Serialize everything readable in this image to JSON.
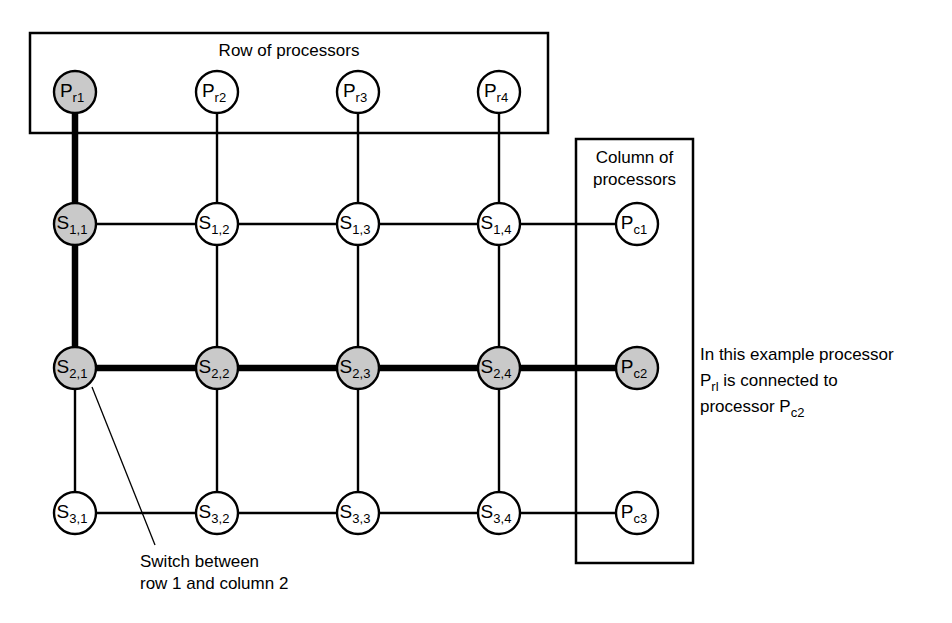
{
  "diagram": {
    "row_box": {
      "label": "Row of processors",
      "x": 30,
      "y": 33,
      "width": 518,
      "height": 100
    },
    "column_box": {
      "label_line1": "Column of",
      "label_line2": "processors",
      "x": 576,
      "y": 139,
      "width": 117,
      "height": 424
    },
    "row_processors": [
      {
        "id": "Pr1",
        "base": "P",
        "sub": "r1",
        "cx": 75,
        "cy": 92,
        "r": 21,
        "state": "active"
      },
      {
        "id": "Pr2",
        "base": "P",
        "sub": "r2",
        "cx": 217,
        "cy": 92,
        "r": 21,
        "state": "plain"
      },
      {
        "id": "Pr3",
        "base": "P",
        "sub": "r3",
        "cx": 358,
        "cy": 92,
        "r": 21,
        "state": "plain"
      },
      {
        "id": "Pr4",
        "base": "P",
        "sub": "r4",
        "cx": 499,
        "cy": 92,
        "r": 21,
        "state": "plain"
      }
    ],
    "column_processors": [
      {
        "id": "Pc1",
        "base": "P",
        "sub": "c1",
        "cx": 637,
        "cy": 224,
        "r": 21,
        "state": "plain"
      },
      {
        "id": "Pc2",
        "base": "P",
        "sub": "c2",
        "cx": 637,
        "cy": 368,
        "r": 21,
        "state": "active"
      },
      {
        "id": "Pc3",
        "base": "P",
        "sub": "c3",
        "cx": 637,
        "cy": 513,
        "r": 21,
        "state": "plain"
      }
    ],
    "switches": [
      {
        "id": "S11",
        "base": "S",
        "sub": "1,1",
        "cx": 75,
        "cy": 224,
        "r": 21,
        "state": "active",
        "row": 1,
        "col": 1
      },
      {
        "id": "S12",
        "base": "S",
        "sub": "1,2",
        "cx": 217,
        "cy": 224,
        "r": 21,
        "state": "plain",
        "row": 1,
        "col": 2
      },
      {
        "id": "S13",
        "base": "S",
        "sub": "1,3",
        "cx": 358,
        "cy": 224,
        "r": 21,
        "state": "plain",
        "row": 1,
        "col": 3
      },
      {
        "id": "S14",
        "base": "S",
        "sub": "1,4",
        "cx": 499,
        "cy": 224,
        "r": 21,
        "state": "plain",
        "row": 1,
        "col": 4
      },
      {
        "id": "S21",
        "base": "S",
        "sub": "2,1",
        "cx": 75,
        "cy": 368,
        "r": 21,
        "state": "active",
        "row": 2,
        "col": 1
      },
      {
        "id": "S22",
        "base": "S",
        "sub": "2,2",
        "cx": 217,
        "cy": 368,
        "r": 21,
        "state": "active",
        "row": 2,
        "col": 2
      },
      {
        "id": "S23",
        "base": "S",
        "sub": "2,3",
        "cx": 358,
        "cy": 368,
        "r": 21,
        "state": "active",
        "row": 2,
        "col": 3
      },
      {
        "id": "S24",
        "base": "S",
        "sub": "2,4",
        "cx": 499,
        "cy": 368,
        "r": 21,
        "state": "active",
        "row": 2,
        "col": 4
      },
      {
        "id": "S31",
        "base": "S",
        "sub": "3,1",
        "cx": 75,
        "cy": 513,
        "r": 21,
        "state": "plain",
        "row": 3,
        "col": 1
      },
      {
        "id": "S32",
        "base": "S",
        "sub": "3,2",
        "cx": 217,
        "cy": 513,
        "r": 21,
        "state": "plain",
        "row": 3,
        "col": 2
      },
      {
        "id": "S33",
        "base": "S",
        "sub": "3,3",
        "cx": 358,
        "cy": 513,
        "r": 21,
        "state": "plain",
        "row": 3,
        "col": 3
      },
      {
        "id": "S34",
        "base": "S",
        "sub": "3,4",
        "cx": 499,
        "cy": 513,
        "r": 21,
        "state": "plain",
        "row": 3,
        "col": 4
      }
    ],
    "links": [
      {
        "from": "Pr1",
        "to": "S11",
        "x1": 75,
        "y1": 113,
        "x2": 75,
        "y2": 203,
        "state": "highlight"
      },
      {
        "from": "Pr2",
        "to": "S12",
        "x1": 217,
        "y1": 113,
        "x2": 217,
        "y2": 203,
        "state": "normal"
      },
      {
        "from": "Pr3",
        "to": "S13",
        "x1": 358,
        "y1": 113,
        "x2": 358,
        "y2": 203,
        "state": "normal"
      },
      {
        "from": "Pr4",
        "to": "S14",
        "x1": 499,
        "y1": 113,
        "x2": 499,
        "y2": 203,
        "state": "normal"
      },
      {
        "from": "S11",
        "to": "S21",
        "x1": 75,
        "y1": 245,
        "x2": 75,
        "y2": 347,
        "state": "highlight"
      },
      {
        "from": "S12",
        "to": "S22",
        "x1": 217,
        "y1": 245,
        "x2": 217,
        "y2": 347,
        "state": "normal"
      },
      {
        "from": "S13",
        "to": "S23",
        "x1": 358,
        "y1": 245,
        "x2": 358,
        "y2": 347,
        "state": "normal"
      },
      {
        "from": "S14",
        "to": "S24",
        "x1": 499,
        "y1": 245,
        "x2": 499,
        "y2": 347,
        "state": "normal"
      },
      {
        "from": "S21",
        "to": "S31",
        "x1": 75,
        "y1": 389,
        "x2": 75,
        "y2": 492,
        "state": "normal"
      },
      {
        "from": "S22",
        "to": "S32",
        "x1": 217,
        "y1": 389,
        "x2": 217,
        "y2": 492,
        "state": "normal"
      },
      {
        "from": "S23",
        "to": "S33",
        "x1": 358,
        "y1": 389,
        "x2": 358,
        "y2": 492,
        "state": "normal"
      },
      {
        "from": "S24",
        "to": "S34",
        "x1": 499,
        "y1": 389,
        "x2": 499,
        "y2": 492,
        "state": "normal"
      },
      {
        "from": "S11",
        "to": "S12",
        "x1": 96,
        "y1": 224,
        "x2": 196,
        "y2": 224,
        "state": "normal"
      },
      {
        "from": "S12",
        "to": "S13",
        "x1": 238,
        "y1": 224,
        "x2": 337,
        "y2": 224,
        "state": "normal"
      },
      {
        "from": "S13",
        "to": "S14",
        "x1": 379,
        "y1": 224,
        "x2": 478,
        "y2": 224,
        "state": "normal"
      },
      {
        "from": "S14",
        "to": "Pc1",
        "x1": 520,
        "y1": 224,
        "x2": 616,
        "y2": 224,
        "state": "normal"
      },
      {
        "from": "S21",
        "to": "S22",
        "x1": 96,
        "y1": 368,
        "x2": 196,
        "y2": 368,
        "state": "highlight"
      },
      {
        "from": "S22",
        "to": "S23",
        "x1": 238,
        "y1": 368,
        "x2": 337,
        "y2": 368,
        "state": "highlight"
      },
      {
        "from": "S23",
        "to": "S24",
        "x1": 379,
        "y1": 368,
        "x2": 478,
        "y2": 368,
        "state": "highlight"
      },
      {
        "from": "S24",
        "to": "Pc2",
        "x1": 520,
        "y1": 368,
        "x2": 616,
        "y2": 368,
        "state": "highlight"
      },
      {
        "from": "S31",
        "to": "S32",
        "x1": 96,
        "y1": 513,
        "x2": 196,
        "y2": 513,
        "state": "normal"
      },
      {
        "from": "S32",
        "to": "S33",
        "x1": 238,
        "y1": 513,
        "x2": 337,
        "y2": 513,
        "state": "normal"
      },
      {
        "from": "S33",
        "to": "S34",
        "x1": 379,
        "y1": 513,
        "x2": 478,
        "y2": 513,
        "state": "normal"
      },
      {
        "from": "S34",
        "to": "Pc3",
        "x1": 520,
        "y1": 513,
        "x2": 616,
        "y2": 513,
        "state": "normal"
      }
    ],
    "switch_annotation": {
      "line1": "Switch between",
      "line2": "row 1 and column 2",
      "text_x": 140,
      "text_y": 567,
      "leader": {
        "x1": 92,
        "y1": 387,
        "x2": 155,
        "y2": 545
      }
    },
    "example_annotation": {
      "line1": "In this example processor",
      "line2_pre": "P",
      "line2_sub": "rl",
      "line2_post": " is connected to",
      "line3_pre": "processor P",
      "line3_sub": "c2",
      "text_x": 700,
      "text_y": 360
    },
    "colors": {
      "active_fill": "#c9c9c9",
      "plain_fill": "#ffffff",
      "stroke": "#000000",
      "background": "#ffffff"
    }
  }
}
